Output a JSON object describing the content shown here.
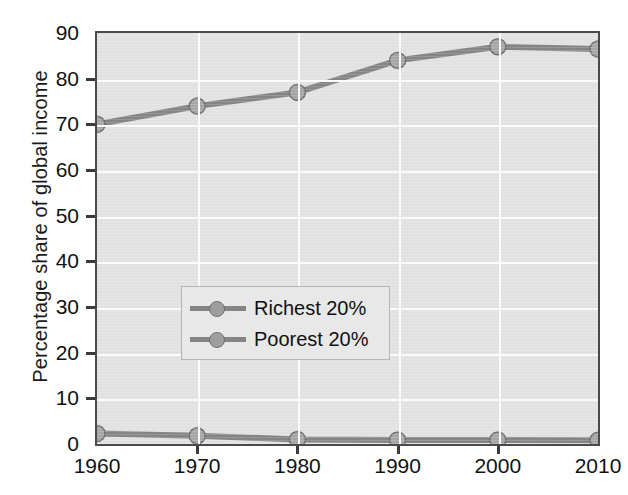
{
  "chart_data": {
    "type": "line",
    "title": "",
    "xlabel": "",
    "ylabel": "Percentage share of global income",
    "categories": [
      "1960",
      "1970",
      "1980",
      "1990",
      "2000",
      "2010"
    ],
    "x": [
      1960,
      1970,
      1980,
      1990,
      2000,
      2010
    ],
    "xlim": [
      1960,
      2010
    ],
    "ylim": [
      0,
      90
    ],
    "ytick_labels": [
      "0",
      "10",
      "20",
      "30",
      "40",
      "50",
      "60",
      "70",
      "80",
      "90"
    ],
    "ytick_values": [
      0,
      10,
      20,
      30,
      40,
      50,
      60,
      70,
      80,
      90
    ],
    "xtick_labels": [
      "1960",
      "1970",
      "1980",
      "1990",
      "2000",
      "2010"
    ],
    "grid": true,
    "grid_color": "#fbfbfb",
    "plot_background": "#e2e2e2",
    "legend_position": "center-left",
    "series": [
      {
        "name": "Richest 20%",
        "color": "#858585",
        "marker": "circle",
        "values": [
          70,
          74,
          77,
          84,
          87,
          86.5
        ]
      },
      {
        "name": "Poorest 20%",
        "color": "#858585",
        "marker": "circle",
        "values": [
          2.3,
          1.8,
          1.0,
          0.9,
          0.9,
          0.8
        ]
      }
    ]
  },
  "legend": {
    "items": [
      {
        "label": "Richest 20%"
      },
      {
        "label": "Poorest 20%"
      }
    ]
  },
  "axes": {
    "y_title": "Percentage share of global income"
  }
}
